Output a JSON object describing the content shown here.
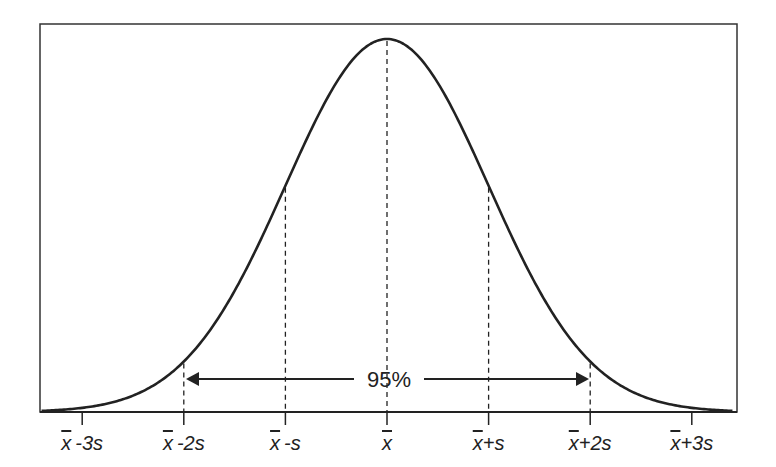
{
  "chart_data": {
    "type": "line",
    "title": "",
    "xlabel": "",
    "ylabel": "",
    "x_ticks": [
      "x̄-3s",
      "x̄-2s",
      "x̄-s",
      "x̄",
      "x̄+s",
      "x̄+2s",
      "x̄+3s"
    ],
    "x_tick_sigma": [
      -3,
      -2,
      -1,
      0,
      1,
      2,
      3
    ],
    "x_range_sigma": [
      -3.4,
      3.4
    ],
    "curve": "gaussian density exp(-z^2/2), peak normalized to 1",
    "dashed_guides_at_sigma": [
      -2,
      -1,
      0,
      1,
      2
    ],
    "annotation": {
      "text": "95%",
      "type": "double-headed arrow",
      "from_sigma": -2,
      "to_sigma": 2
    },
    "grid": false,
    "legend": null
  },
  "labels": {
    "ticks": [
      {
        "bar": "x",
        "rest": "-3s"
      },
      {
        "bar": "x",
        "rest": "-2s"
      },
      {
        "bar": "x",
        "rest": "-s"
      },
      {
        "bar": "x",
        "rest": ""
      },
      {
        "bar": "x",
        "rest": "+s"
      },
      {
        "bar": "x",
        "rest": "+2s"
      },
      {
        "bar": "x",
        "rest": "+3s"
      }
    ],
    "interval": "95%"
  },
  "colors": {
    "line": "#222222",
    "frame": "#333333",
    "background": "#ffffff",
    "text": "#222222"
  }
}
